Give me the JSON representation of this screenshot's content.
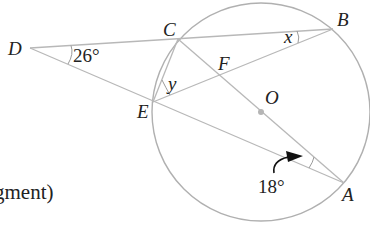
{
  "diagram": {
    "type": "circle-geometry",
    "circle": {
      "center_label": "O",
      "center": [
        261,
        112
      ],
      "radius": 109
    },
    "points": {
      "A": {
        "label": "A",
        "pos": [
          344,
          183
        ]
      },
      "B": {
        "label": "B",
        "pos": [
          333,
          29
        ]
      },
      "C": {
        "label": "C",
        "pos": [
          178,
          39
        ]
      },
      "D": {
        "label": "D",
        "pos": [
          30,
          48
        ]
      },
      "E": {
        "label": "E",
        "pos": [
          153,
          102
        ]
      },
      "F": {
        "label": "F",
        "pos": [
          220,
          77
        ]
      },
      "O": {
        "label": "O",
        "pos": [
          261,
          112
        ]
      }
    },
    "segments": [
      "D-B",
      "D-A",
      "C-A",
      "E-B",
      "C-E"
    ],
    "angles": {
      "D": {
        "label": "26°",
        "at": "D"
      },
      "B": {
        "label": "x",
        "at": "B"
      },
      "E": {
        "label": "y",
        "at": "E"
      },
      "A": {
        "label": "18°",
        "at": "A"
      }
    }
  },
  "partial_text": "gment)"
}
